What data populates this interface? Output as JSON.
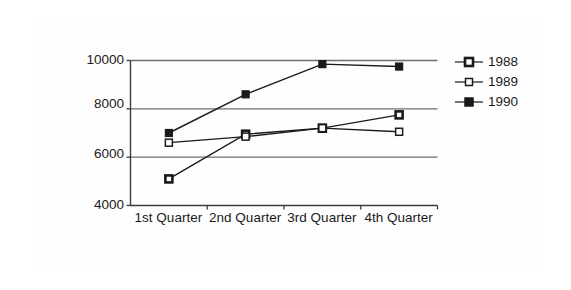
{
  "chart_data": {
    "type": "line",
    "title": "",
    "subtitle": "",
    "xlabel": "",
    "ylabel": "",
    "categories": [
      "1st Quarter",
      "2nd Quarter",
      "3rd Quarter",
      "4th Quarter"
    ],
    "series": [
      {
        "name": "1988",
        "marker": "square-outline-thick",
        "color": "#1a1a1a",
        "values": [
          5100,
          6950,
          7200,
          7750
        ]
      },
      {
        "name": "1989",
        "marker": "square-open",
        "color": "#1a1a1a",
        "values": [
          6600,
          6850,
          7200,
          7050
        ]
      },
      {
        "name": "1990",
        "marker": "square-filled",
        "color": "#1a1a1a",
        "values": [
          7000,
          8600,
          9850,
          9750
        ]
      }
    ],
    "ylim": [
      4000,
      10000
    ],
    "y_ticks": [
      4000,
      6000,
      8000,
      10000
    ],
    "y_tick_labels": [
      "4000",
      "6000",
      "8000",
      "10000"
    ],
    "grid": true,
    "grid_axis": "y",
    "legend_position": "right",
    "legend_entries": [
      "1988",
      "1989",
      "1990"
    ],
    "frame": "box"
  },
  "colors": {
    "line": "#1a1a1a",
    "grid": "#6e6e6e",
    "axis": "#3a3a3a",
    "frame": "#4a4a4a",
    "background": "#ffffff",
    "marker_fill_open": "#ffffff",
    "marker_fill_solid": "#1a1a1a"
  }
}
